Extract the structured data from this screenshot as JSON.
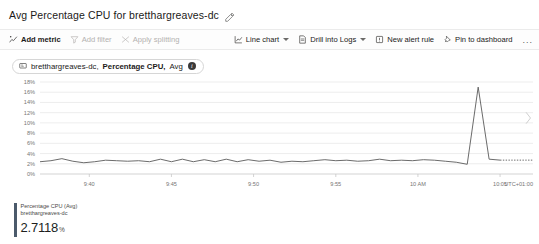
{
  "header": {
    "title": "Avg Percentage CPU for bretthargreaves-dc",
    "edit_icon": "pencil-icon"
  },
  "toolbar": {
    "left": [
      {
        "label": "Add metric",
        "icon": "add-metric-icon",
        "disabled": false,
        "caret": false
      },
      {
        "label": "Add filter",
        "icon": "filter-icon",
        "disabled": true,
        "caret": false
      },
      {
        "label": "Apply splitting",
        "icon": "splitting-icon",
        "disabled": true,
        "caret": false
      }
    ],
    "right": [
      {
        "label": "Line chart",
        "icon": "line-chart-icon",
        "disabled": false,
        "caret": true
      },
      {
        "label": "Drill into Logs",
        "icon": "logs-icon",
        "disabled": false,
        "caret": true
      },
      {
        "label": "New alert rule",
        "icon": "alert-icon",
        "disabled": false,
        "caret": false
      },
      {
        "label": "Pin to dashboard",
        "icon": "pin-icon",
        "disabled": false,
        "caret": false
      }
    ],
    "overflow_label": "..."
  },
  "metric_pill": {
    "icon": "resource-icon",
    "resource": "bretthargreaves-dc,",
    "metric": "Percentage CPU,",
    "aggregation": "Avg",
    "info_icon": "info-icon",
    "info_glyph": "i"
  },
  "legend": {
    "metric_line": "Percentage CPU (Avg)",
    "resource_line": "bretthargreaves-dc",
    "value": "2.7118",
    "unit": "%",
    "color": "#4b5a6b"
  },
  "side_nav": {
    "next_icon": "chevron-right-icon"
  },
  "chart_data": {
    "type": "line",
    "title": "Avg Percentage CPU for bretthargreaves-dc",
    "xlabel": "",
    "ylabel": "",
    "timezone": "UTC+01:00",
    "grid": true,
    "legend_position": "bottom",
    "ylim": [
      0,
      18
    ],
    "yticks": [
      0,
      2,
      4,
      6,
      8,
      10,
      12,
      14,
      16,
      18
    ],
    "ytick_labels": [
      "0%",
      "2%",
      "4%",
      "6%",
      "8%",
      "10%",
      "12%",
      "14%",
      "16%",
      "18%"
    ],
    "xticks": [
      9.6667,
      9.75,
      9.8333,
      9.9167,
      10.0,
      10.0833
    ],
    "xtick_labels": [
      "9:40",
      "9:45",
      "9:50",
      "9:55",
      "10 AM",
      "10:05"
    ],
    "xlim": [
      9.6167,
      10.1167
    ],
    "series": [
      {
        "name": "Percentage CPU (Avg)",
        "color": "#5a5a5a",
        "unit": "%",
        "x": [
          9.6167,
          9.6278,
          9.6389,
          9.65,
          9.6611,
          9.6722,
          9.6833,
          9.6944,
          9.7056,
          9.7167,
          9.7278,
          9.7389,
          9.75,
          9.7611,
          9.7722,
          9.7833,
          9.7944,
          9.8056,
          9.8167,
          9.8278,
          9.8389,
          9.85,
          9.8611,
          9.8722,
          9.8833,
          9.8944,
          9.9056,
          9.9167,
          9.9278,
          9.9389,
          9.95,
          9.9611,
          9.9722,
          9.9833,
          9.9944,
          10.0056,
          10.0167,
          10.0278,
          10.0389,
          10.05,
          10.0611,
          10.0722,
          10.0833
        ],
        "values": [
          2.4,
          2.6,
          3.0,
          2.5,
          2.2,
          2.4,
          2.7,
          2.6,
          2.5,
          2.6,
          2.4,
          2.9,
          2.4,
          2.9,
          2.4,
          2.8,
          2.4,
          2.9,
          2.4,
          2.8,
          2.5,
          2.7,
          2.3,
          2.5,
          2.4,
          2.6,
          2.8,
          2.6,
          2.7,
          2.5,
          2.6,
          2.9,
          2.6,
          2.7,
          2.6,
          2.8,
          2.7,
          2.5,
          2.3,
          1.9,
          17.0,
          2.9,
          2.7118
        ]
      }
    ],
    "forecast_segment": {
      "style": "dotted",
      "value": 2.7118,
      "x_start": 10.0833,
      "x_end": 10.1167
    }
  }
}
